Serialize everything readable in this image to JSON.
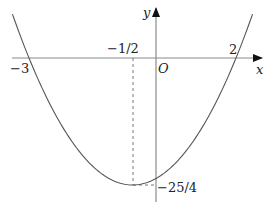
{
  "chart_data": {
    "type": "line",
    "title": "",
    "function": "y = x^2 + x - 6",
    "xlabel": "x",
    "ylabel": "y",
    "origin_label": "O",
    "annotations": [
      {
        "text": "-3",
        "meaning": "root x=-3"
      },
      {
        "text": "2",
        "meaning": "root x=2"
      },
      {
        "text": "-1/2",
        "meaning": "vertex x-coordinate"
      },
      {
        "text": "-25/4",
        "meaning": "vertex y-coordinate (minimum)"
      }
    ],
    "roots": [
      -3,
      2
    ],
    "vertex": {
      "x": -0.5,
      "y": -6.25
    },
    "x_range_shown": [
      -3.4,
      2.4
    ],
    "grid": false,
    "legend": null
  },
  "labels": {
    "x_axis": "x",
    "y_axis": "y",
    "origin": "O",
    "root_left": "−3",
    "root_right": "2",
    "vertex_x": "−1/2",
    "vertex_y": "−25/4"
  },
  "colors": {
    "axis": "#8a8a8a",
    "curve": "#555555",
    "dashed": "#777777",
    "text": "#222222"
  }
}
